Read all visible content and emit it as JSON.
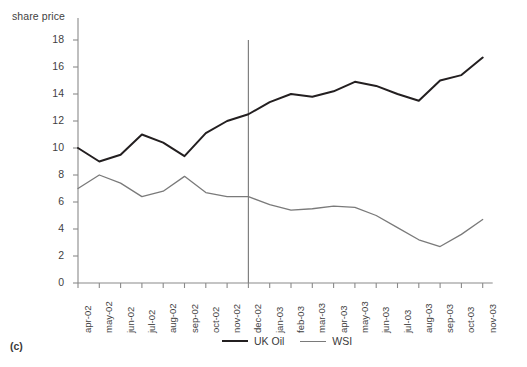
{
  "figure": {
    "panel_label": "(c)",
    "y_axis_title": "share price"
  },
  "legend": {
    "position": "bottom-center",
    "items": [
      {
        "label": "UK Oil",
        "style": "thick",
        "color": "#231f20"
      },
      {
        "label": "WSI",
        "style": "thin",
        "color": "#7a7a7a"
      }
    ]
  },
  "annotations": {
    "divider": {
      "at_category": "dec-02",
      "description": "vertical reference line at dec-02"
    }
  },
  "chart_data": {
    "type": "line",
    "title": "",
    "xlabel": "",
    "ylabel": "share price",
    "ylim": [
      0,
      18
    ],
    "yticks": [
      0,
      2,
      4,
      6,
      8,
      10,
      12,
      14,
      16,
      18
    ],
    "ytick_labels": [
      "0",
      "2",
      "4",
      "6",
      "8",
      "10",
      "12",
      "14",
      "16",
      "18"
    ],
    "grid": false,
    "legend_position": "bottom-center",
    "categories": [
      "apr-02",
      "may-02",
      "jun-02",
      "jul-02",
      "aug-02",
      "sep-02",
      "oct-02",
      "nov-02",
      "dec-02",
      "jan-03",
      "feb-03",
      "mar-03",
      "apr-03",
      "may-03",
      "jun-03",
      "jul-03",
      "aug-03",
      "sep-03",
      "oct-03",
      "nov-03"
    ],
    "series": [
      {
        "name": "UK Oil",
        "color": "#231f20",
        "width": 2,
        "values": [
          10.0,
          9.0,
          9.5,
          11.0,
          10.4,
          9.4,
          11.1,
          12.0,
          12.5,
          13.4,
          14.0,
          13.8,
          14.2,
          14.9,
          14.6,
          14.0,
          13.5,
          15.0,
          15.4,
          16.7
        ]
      },
      {
        "name": "WSI",
        "color": "#7a7a7a",
        "width": 1.3,
        "values": [
          7.0,
          8.0,
          7.4,
          6.4,
          6.8,
          7.9,
          6.7,
          6.4,
          6.4,
          5.8,
          5.4,
          5.5,
          5.7,
          5.6,
          5.0,
          4.1,
          3.2,
          2.7,
          3.6,
          4.7
        ]
      }
    ],
    "vertical_line": {
      "category": "dec-02",
      "y_top": 18,
      "y_bottom": 0,
      "color": "#808080"
    }
  }
}
